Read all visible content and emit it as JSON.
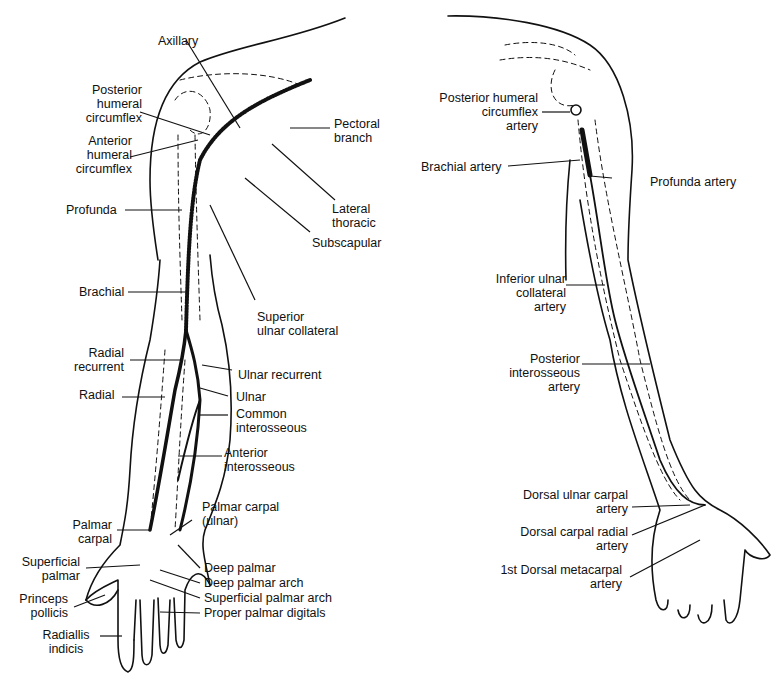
{
  "figure": {
    "left_view": {
      "name": "anterior arm arteries",
      "labels": [
        {
          "id": "axillary",
          "text": "Axillary"
        },
        {
          "id": "posterior-humeral-circumflex",
          "text": "Posterior\nhumeral\ncircumflex"
        },
        {
          "id": "anterior-humeral-circumflex",
          "text": "Anterior\nhumeral\ncircumflex"
        },
        {
          "id": "pectoral-branch",
          "text": "Pectoral\nbranch"
        },
        {
          "id": "profunda",
          "text": "Profunda"
        },
        {
          "id": "lateral-thoracic",
          "text": "Lateral\nthoracic"
        },
        {
          "id": "subscapular",
          "text": "Subscapular"
        },
        {
          "id": "brachial",
          "text": "Brachial"
        },
        {
          "id": "superior-ulnar-collateral",
          "text": "Superior\nulnar collateral"
        },
        {
          "id": "radial-recurrent",
          "text": "Radial\nrecurrent"
        },
        {
          "id": "ulnar-recurrent",
          "text": "Ulnar recurrent"
        },
        {
          "id": "radial",
          "text": "Radial"
        },
        {
          "id": "ulnar",
          "text": "Ulnar"
        },
        {
          "id": "common-interosseous",
          "text": "Common\ninterosseous"
        },
        {
          "id": "anterior-interosseous",
          "text": "Anterior\ninterosseous"
        },
        {
          "id": "palmar-carpal-ulnar",
          "text": "Palmar carpal\n(ulnar)"
        },
        {
          "id": "palmar-carpal",
          "text": "Palmar\ncarpal"
        },
        {
          "id": "superficial-palmar",
          "text": "Superficial\npalmar"
        },
        {
          "id": "deep-palmar",
          "text": "Deep palmar"
        },
        {
          "id": "deep-palmar-arch",
          "text": "Deep palmar arch"
        },
        {
          "id": "superficial-palmar-arch",
          "text": "Superficial palmar arch"
        },
        {
          "id": "proper-palmar-digitals",
          "text": "Proper palmar digitals"
        },
        {
          "id": "princeps-pollicis",
          "text": "Princeps\npollicis"
        },
        {
          "id": "radiallis-indicis",
          "text": "Radiallis\nindicis"
        }
      ]
    },
    "right_view": {
      "name": "posterior arm arteries",
      "labels": [
        {
          "id": "posterior-humeral-circumflex-artery",
          "text": "Posterior humeral\ncircumflex\nartery"
        },
        {
          "id": "brachial-artery",
          "text": "Brachial artery"
        },
        {
          "id": "profunda-artery",
          "text": "Profunda artery"
        },
        {
          "id": "inferior-ulnar-collateral-artery",
          "text": "Inferior ulnar\ncollateral\nartery"
        },
        {
          "id": "posterior-interosseous-artery",
          "text": "Posterior\ninterosseous\nartery"
        },
        {
          "id": "dorsal-ulnar-carpal-artery",
          "text": "Dorsal ulnar carpal\nartery"
        },
        {
          "id": "dorsal-carpal-radial-artery",
          "text": "Dorsal carpal radial\nartery"
        },
        {
          "id": "first-dorsal-metacarpal-artery",
          "text": "1st Dorsal metacarpal\nartery"
        }
      ]
    }
  }
}
